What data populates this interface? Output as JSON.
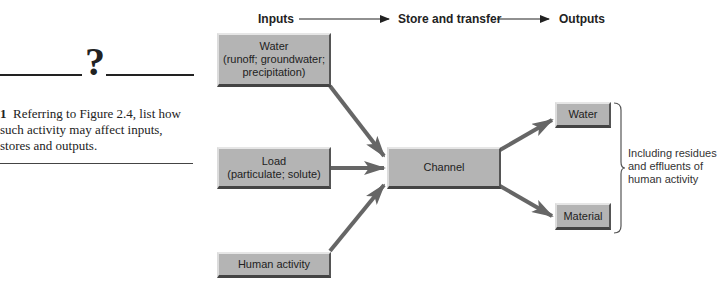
{
  "sidebar": {
    "question_mark": "?",
    "question_number": "1",
    "question_text": "Referring to Figure 2.4, list how such activity may affect inputs, stores and outputs."
  },
  "header": {
    "inputs": "Inputs",
    "store": "Store and transfer",
    "outputs": "Outputs"
  },
  "inputs": [
    {
      "title": "Water",
      "detail": "(runoff; groundwater; precipitation)"
    },
    {
      "title": "Load",
      "detail": "(particulate; solute)"
    },
    {
      "title": "Human activity",
      "detail": ""
    }
  ],
  "store": {
    "title": "Channel"
  },
  "outputs": [
    {
      "title": "Water"
    },
    {
      "title": "Material"
    }
  ],
  "note": "Including residues and effluents of human activity",
  "colors": {
    "box_fill": "#b4b4b4",
    "arrow": "#666666",
    "text": "#222222"
  }
}
